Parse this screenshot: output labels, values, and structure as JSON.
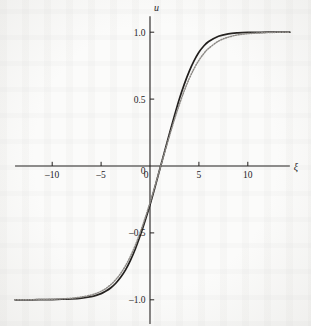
{
  "figure": {
    "name": "sigmoid-traveling-wave-plot",
    "background_color": "#fbfbfa",
    "ink_color": "#211e1c",
    "secondary_curve_color": "#8d8a86"
  },
  "chart_data": {
    "type": "line",
    "title": "",
    "subtitle": "",
    "xlabel": "ξ",
    "ylabel": "u",
    "xlim": [
      -13.8,
      14.3
    ],
    "ylim": [
      -1.18,
      1.12
    ],
    "grid": false,
    "legend": null,
    "legend_position": "none",
    "xticks": [
      -10,
      -5,
      0,
      5,
      10
    ],
    "xtick_labels": [
      "–10",
      "–5",
      "0",
      "5",
      "10"
    ],
    "yticks": [
      1.0,
      0.5,
      0,
      -0.5,
      -1.0
    ],
    "ytick_labels": [
      "1.0",
      "0.5",
      "0",
      "–0.5",
      "–1.0"
    ],
    "annotations": [],
    "series": [
      {
        "name": "solid-curve",
        "style": "solid",
        "color": "#211e1c",
        "width": 1.7,
        "x": [
          -13.8,
          -13.0,
          -12.0,
          -11.0,
          -10.0,
          -9.0,
          -8.0,
          -7.0,
          -6.0,
          -5.5,
          -5.0,
          -4.5,
          -4.0,
          -3.5,
          -3.0,
          -2.5,
          -2.0,
          -1.5,
          -1.0,
          -0.5,
          0.0,
          0.5,
          1.0,
          1.5,
          2.0,
          2.5,
          3.0,
          3.5,
          4.0,
          4.5,
          5.0,
          5.5,
          6.0,
          7.0,
          8.0,
          9.0,
          10.0,
          11.0,
          12.0,
          13.0,
          14.3
        ],
        "y": [
          -1.0,
          -1.0,
          -1.0,
          -0.999,
          -0.998,
          -0.996,
          -0.993,
          -0.987,
          -0.976,
          -0.967,
          -0.954,
          -0.935,
          -0.91,
          -0.876,
          -0.832,
          -0.776,
          -0.705,
          -0.62,
          -0.52,
          -0.41,
          -0.29,
          -0.16,
          -0.025,
          0.11,
          0.245,
          0.375,
          0.5,
          0.61,
          0.705,
          0.785,
          0.85,
          0.897,
          0.93,
          0.97,
          0.988,
          0.995,
          0.998,
          0.999,
          1.0,
          1.0,
          1.0
        ]
      },
      {
        "name": "dotted-curve",
        "style": "dotted",
        "color": "#8d8a86",
        "width": 1.5,
        "x": [
          -13.8,
          -13.0,
          -12.0,
          -11.0,
          -10.0,
          -9.0,
          -8.0,
          -7.0,
          -6.0,
          -5.5,
          -5.0,
          -4.5,
          -4.0,
          -3.5,
          -3.0,
          -2.5,
          -2.0,
          -1.5,
          -1.0,
          -0.5,
          0.0,
          0.5,
          1.0,
          1.5,
          2.0,
          2.5,
          3.0,
          3.5,
          4.0,
          4.5,
          5.0,
          5.5,
          6.0,
          7.0,
          8.0,
          9.0,
          10.0,
          11.0,
          12.0,
          13.0,
          14.3
        ],
        "y": [
          -1.0,
          -1.0,
          -0.999,
          -0.998,
          -0.996,
          -0.993,
          -0.988,
          -0.979,
          -0.964,
          -0.952,
          -0.936,
          -0.915,
          -0.886,
          -0.849,
          -0.803,
          -0.745,
          -0.675,
          -0.592,
          -0.497,
          -0.39,
          -0.275,
          -0.152,
          -0.025,
          0.103,
          0.228,
          0.348,
          0.46,
          0.562,
          0.651,
          0.727,
          0.79,
          0.84,
          0.879,
          0.933,
          0.963,
          0.98,
          0.989,
          0.994,
          0.997,
          0.999,
          1.0
        ]
      }
    ]
  }
}
